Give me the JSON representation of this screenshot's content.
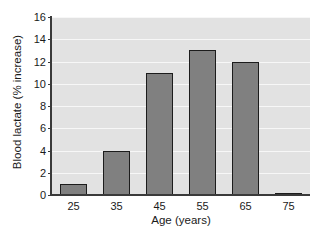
{
  "chart_data": {
    "type": "bar",
    "title": "",
    "xlabel": "Age (years)",
    "ylabel": "Blood lactate (% increase)",
    "categories": [
      "25",
      "35",
      "45",
      "55",
      "65",
      "75"
    ],
    "values": [
      1,
      4,
      11,
      13,
      12,
      0.1
    ],
    "series": [
      {
        "name": "Blood lactate (% increase)",
        "values": [
          1,
          4,
          11,
          13,
          12,
          0.1
        ]
      }
    ],
    "ylim": [
      0,
      16
    ],
    "yticks": [
      "0",
      "2",
      "4",
      "6",
      "8",
      "10",
      "12",
      "14",
      "16"
    ],
    "ytick_values": [
      0,
      2,
      4,
      6,
      8,
      10,
      12,
      14,
      16
    ],
    "xtick_labels": [
      "25",
      "35",
      "45",
      "55",
      "65",
      "75"
    ],
    "grid": "horizontal",
    "legend": "none",
    "colors": {
      "bar_fill": "#808080",
      "bar_edge": "#1c1c1c",
      "plot_background": "#e2e2e2",
      "gridline": "#f7f7f7",
      "axis": "#3a3a3a",
      "text": "#1a1a1a",
      "figure_background": "#ffffff"
    }
  }
}
